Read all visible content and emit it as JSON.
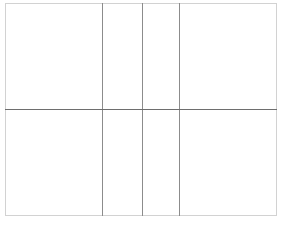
{
  "page": {
    "title": "",
    "background_color": "#ffffff"
  },
  "grid": {
    "name": "empty-table-grid",
    "rows_count": 2,
    "columns_count": 4,
    "outer_border_color": "#d2d2d2",
    "inner_line_color": "#8c8c8c",
    "row_divider_color": "#6e6e6e",
    "cell_background": "#ffffff",
    "column_widths_pct": [
      36.0,
      14.7,
      13.2,
      36.1
    ],
    "row_heights_pct": [
      50.2,
      49.8
    ],
    "rows": [
      {
        "name": "table-row-1",
        "cells": [
          {
            "name": "cell-r1c1",
            "text": ""
          },
          {
            "name": "cell-r1c2",
            "text": ""
          },
          {
            "name": "cell-r1c3",
            "text": ""
          },
          {
            "name": "cell-r1c4",
            "text": ""
          }
        ]
      },
      {
        "name": "table-row-2",
        "cells": [
          {
            "name": "cell-r2c1",
            "text": ""
          },
          {
            "name": "cell-r2c2",
            "text": ""
          },
          {
            "name": "cell-r2c3",
            "text": ""
          },
          {
            "name": "cell-r2c4",
            "text": ""
          }
        ]
      }
    ]
  }
}
